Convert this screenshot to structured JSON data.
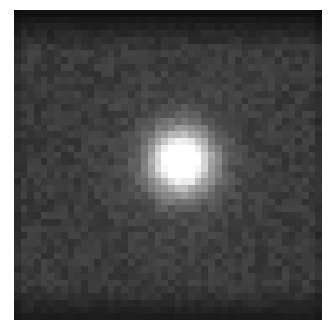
{
  "image": {
    "description": "Grayscale pixelated image of a bright point source (star) centered slightly right of middle, surrounded by a dim diffuse halo on a dark noisy background",
    "grid": {
      "cols": 46,
      "rows": 46
    },
    "source": {
      "cx": 24.5,
      "cy": 22.0,
      "core_radius": 3.2,
      "halo_radius": 7.5
    },
    "levels": {
      "background": 58,
      "edge_top": 18,
      "edge_bottom": 22,
      "halo": 120,
      "core": 252
    },
    "colors": {
      "page_background": "#ffffff",
      "frame_background": "#111111"
    }
  }
}
